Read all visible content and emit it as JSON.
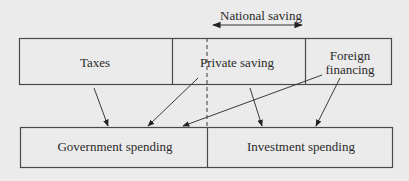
{
  "diagram": {
    "national_saving_label": "National saving",
    "top_row": {
      "taxes": "Taxes",
      "private_saving": "Private saving",
      "foreign_financing_line1": "Foreign",
      "foreign_financing_line2": "financing"
    },
    "bottom_row": {
      "government_spending": "Government spending",
      "investment_spending": "Investment spending"
    },
    "flows": [
      {
        "from": "Taxes",
        "to": "Government spending"
      },
      {
        "from": "Private saving",
        "to": "Government spending"
      },
      {
        "from": "Foreign financing",
        "to": "Government spending"
      },
      {
        "from": "Private saving",
        "to": "Investment spending"
      },
      {
        "from": "Foreign financing",
        "to": "Investment spending"
      }
    ],
    "colors": {
      "background": "#ebebeb",
      "line": "#4a4a4a",
      "text": "#2a2a2a"
    }
  }
}
